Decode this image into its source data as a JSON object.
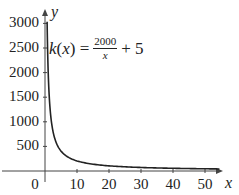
{
  "chart_data": {
    "type": "line",
    "title": "",
    "function_label": {
      "lhs": "k(x) = ",
      "numerator": "2000",
      "denominator": "x",
      "rhs": "+ 5"
    },
    "function": "k(x) = 2000/x + 5",
    "xlabel": "x",
    "ylabel": "y",
    "xlim": [
      0,
      55
    ],
    "ylim": [
      0,
      3100
    ],
    "x_ticks": [
      0,
      10,
      20,
      30,
      40,
      50
    ],
    "x_tick_labels": [
      "0",
      "10",
      "20",
      "30",
      "40",
      "50"
    ],
    "y_ticks": [
      500,
      1000,
      1500,
      2000,
      2500,
      3000
    ],
    "y_tick_labels": [
      "500",
      "1000",
      "1500",
      "2000",
      "2500",
      "3000"
    ],
    "grid": false,
    "legend": null,
    "series": [
      {
        "name": "k(x)",
        "color": "#222222",
        "x": [
          0.65,
          0.8,
          1,
          1.5,
          2,
          3,
          4,
          5,
          7,
          10,
          15,
          20,
          30,
          40,
          50,
          55
        ],
        "values": [
          3082,
          2505,
          2005,
          1338,
          1005,
          672,
          505,
          405,
          291,
          205,
          138,
          105,
          72,
          55,
          45,
          41
        ]
      }
    ]
  },
  "axes": {
    "x_name": "x",
    "y_name": "y"
  }
}
